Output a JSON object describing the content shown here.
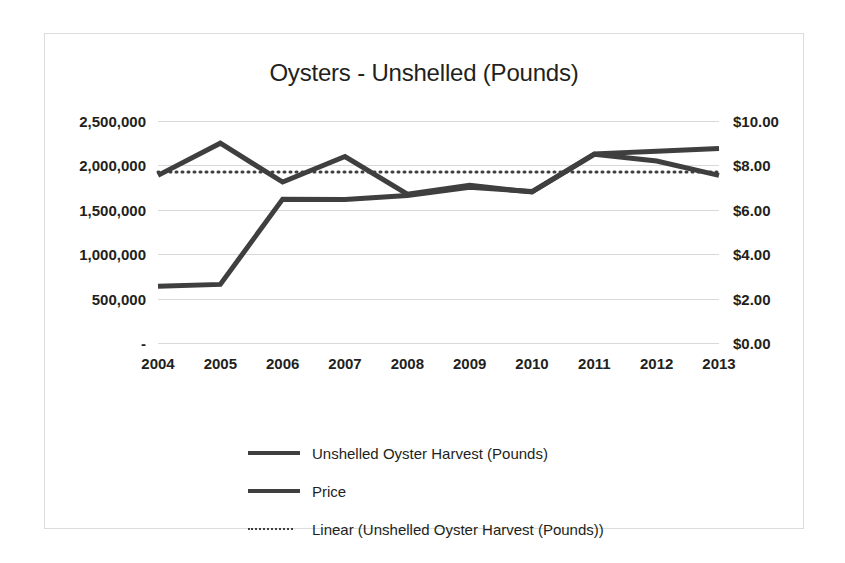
{
  "chart_data": {
    "type": "line",
    "title": "Oysters - Unshelled (Pounds)",
    "xlabel": "",
    "ylabel": "",
    "grid": true,
    "legend_position": "bottom",
    "categories": [
      "2004",
      "2005",
      "2006",
      "2007",
      "2008",
      "2009",
      "2010",
      "2011",
      "2012",
      "2013"
    ],
    "y_left": {
      "label": "",
      "ticks": [
        "-",
        "500,000",
        "1,000,000",
        "1,500,000",
        "2,000,000",
        "2,500,000"
      ],
      "tick_values": [
        0,
        500000,
        1000000,
        1500000,
        2000000,
        2500000
      ],
      "ylim": [
        0,
        2500000
      ]
    },
    "y_right": {
      "label": "",
      "ticks": [
        "$0.00",
        "$2.00",
        "$4.00",
        "$6.00",
        "$8.00",
        "$10.00"
      ],
      "tick_values": [
        0,
        2,
        4,
        6,
        8,
        10
      ],
      "ylim": [
        0,
        10
      ]
    },
    "series": [
      {
        "name": "Unshelled Oyster Harvest (Pounds)",
        "axis": "left",
        "style": "solid",
        "color": "#3f3f3f",
        "values": [
          640000,
          660000,
          1620000,
          1615000,
          1660000,
          1755000,
          1705000,
          2130000,
          2160000,
          2190000
        ]
      },
      {
        "name": "Price",
        "axis": "right",
        "style": "solid",
        "color": "#3f3f3f",
        "values": [
          7.55,
          9.0,
          7.25,
          8.4,
          6.7,
          7.1,
          6.8,
          8.5,
          8.2,
          7.55
        ]
      },
      {
        "name": "Linear (Unshelled Oyster Harvest (Pounds))",
        "axis": "left",
        "style": "dotted",
        "color": "#3f3f3f",
        "trendline": true,
        "values": [
          1925000,
          1925000,
          1925000,
          1925000,
          1925000,
          1925000,
          1925000,
          1925000,
          1925000,
          1925000
        ]
      }
    ]
  },
  "legend": {
    "items": [
      {
        "label": "Unshelled Oyster Harvest (Pounds)",
        "style": "solid"
      },
      {
        "label": "Price",
        "style": "solid"
      },
      {
        "label": "Linear (Unshelled Oyster Harvest (Pounds))",
        "style": "dotted"
      }
    ]
  }
}
